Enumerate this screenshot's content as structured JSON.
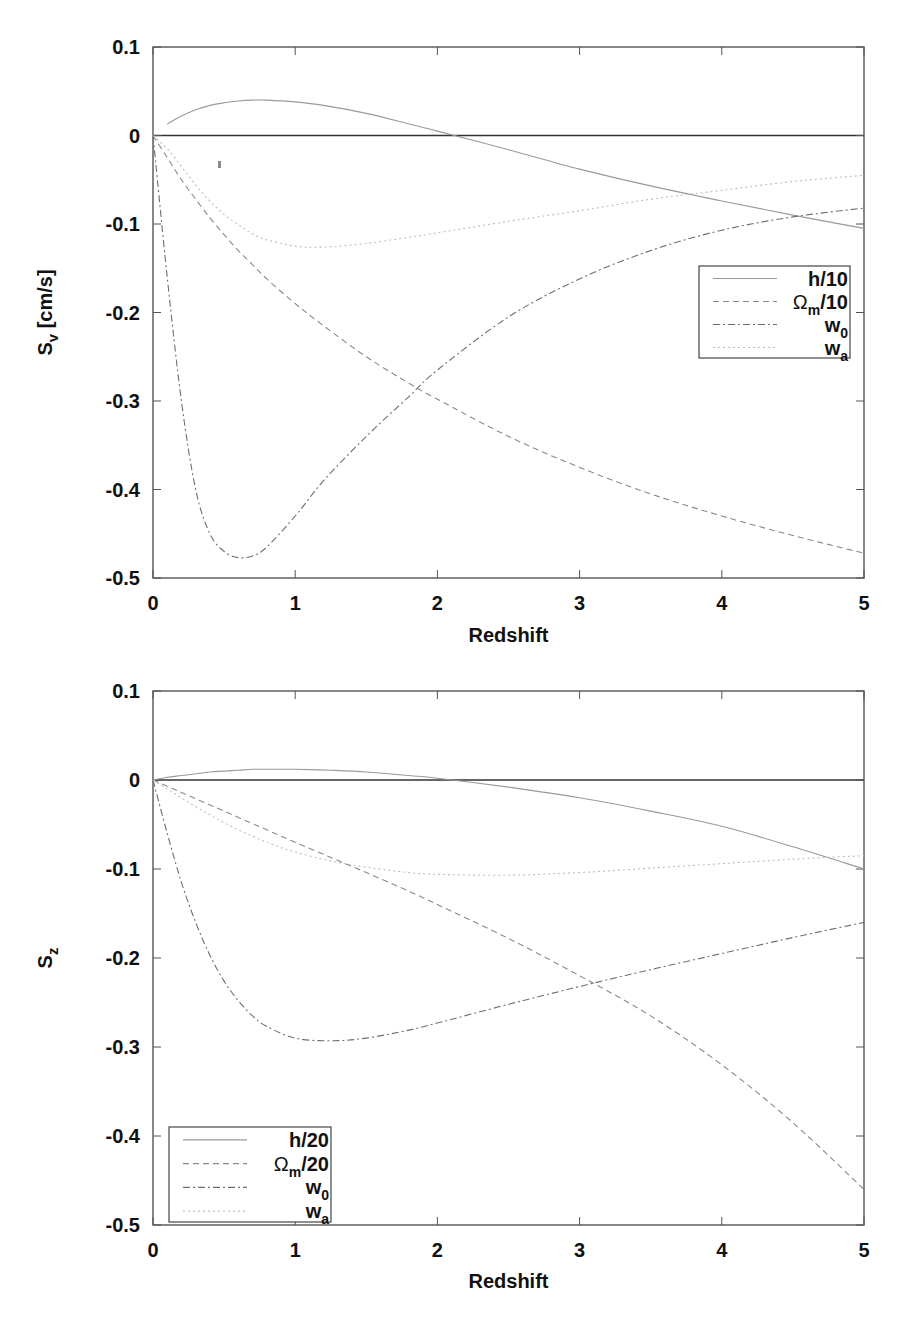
{
  "chart_data": [
    {
      "type": "line",
      "title": "",
      "xlabel": "Redshift",
      "ylabel": "S_v [cm/s]",
      "ylabel_main": "S",
      "ylabel_sub": "v",
      "ylabel_unit": " [cm/s]",
      "xlim": [
        0,
        5
      ],
      "ylim": [
        -0.5,
        0.1
      ],
      "xticks": [
        "0",
        "1",
        "2",
        "3",
        "4",
        "5"
      ],
      "yticks": [
        "0.1",
        "0",
        "-0.1",
        "-0.2",
        "-0.3",
        "-0.4",
        "-0.5"
      ],
      "grid": false,
      "zero_line": true,
      "legend_position": "right-middle",
      "legend": [
        {
          "main": "h/10",
          "sub": "",
          "tail": ""
        },
        {
          "main": "Ω",
          "sub": "m",
          "tail": "/10"
        },
        {
          "main": "w",
          "sub": "0",
          "tail": ""
        },
        {
          "main": "w",
          "sub": "a",
          "tail": ""
        }
      ],
      "x": [
        0,
        0.1,
        0.2,
        0.3,
        0.4,
        0.5,
        0.6,
        0.7,
        0.8,
        1.0,
        1.2,
        1.5,
        1.8,
        2.0,
        2.5,
        3.0,
        3.5,
        4.0,
        4.5,
        5.0
      ],
      "series": [
        {
          "name": "h/10",
          "style": "solid",
          "values": [
            null,
            0.013,
            0.022,
            0.029,
            0.034,
            0.037,
            0.039,
            0.04,
            0.04,
            0.038,
            0.034,
            0.025,
            0.013,
            0.005,
            -0.016,
            -0.038,
            -0.057,
            -0.074,
            -0.09,
            -0.105
          ]
        },
        {
          "name": "Ωm/10",
          "style": "dashed",
          "values": [
            0,
            -0.025,
            -0.05,
            -0.072,
            -0.093,
            -0.112,
            -0.13,
            -0.146,
            -0.162,
            -0.19,
            -0.215,
            -0.25,
            -0.28,
            -0.298,
            -0.34,
            -0.375,
            -0.405,
            -0.43,
            -0.452,
            -0.472
          ]
        },
        {
          "name": "w0",
          "style": "dashdot",
          "values": [
            0,
            -0.16,
            -0.3,
            -0.4,
            -0.45,
            -0.47,
            -0.477,
            -0.475,
            -0.465,
            -0.43,
            -0.39,
            -0.34,
            -0.295,
            -0.265,
            -0.205,
            -0.162,
            -0.13,
            -0.107,
            -0.092,
            -0.082
          ]
        },
        {
          "name": "wa",
          "style": "dotted",
          "values": [
            0,
            -0.015,
            -0.035,
            -0.056,
            -0.074,
            -0.089,
            -0.101,
            -0.111,
            -0.118,
            -0.125,
            -0.126,
            -0.122,
            -0.115,
            -0.11,
            -0.097,
            -0.085,
            -0.072,
            -0.062,
            -0.052,
            -0.045
          ]
        }
      ]
    },
    {
      "type": "line",
      "title": "",
      "xlabel": "Redshift",
      "ylabel": "S_z",
      "ylabel_main": "S",
      "ylabel_sub": "z",
      "ylabel_unit": "",
      "xlim": [
        0,
        5
      ],
      "ylim": [
        -0.5,
        0.1
      ],
      "xticks": [
        "0",
        "1",
        "2",
        "3",
        "4",
        "5"
      ],
      "yticks": [
        "0.1",
        "0",
        "-0.1",
        "-0.2",
        "-0.3",
        "-0.4",
        "-0.5"
      ],
      "grid": false,
      "zero_line": true,
      "legend_position": "lower-left",
      "legend": [
        {
          "main": "h/20",
          "sub": "",
          "tail": ""
        },
        {
          "main": "Ω",
          "sub": "m",
          "tail": "/20"
        },
        {
          "main": "w",
          "sub": "0",
          "tail": ""
        },
        {
          "main": "w",
          "sub": "a",
          "tail": ""
        }
      ],
      "x": [
        0,
        0.1,
        0.2,
        0.3,
        0.4,
        0.5,
        0.6,
        0.7,
        0.8,
        1.0,
        1.25,
        1.5,
        1.8,
        2.0,
        2.5,
        3.0,
        3.5,
        4.0,
        4.5,
        5.0
      ],
      "series": [
        {
          "name": "h/20",
          "style": "solid",
          "values": [
            0,
            0.003,
            0.005,
            0.007,
            0.009,
            0.01,
            0.011,
            0.012,
            0.012,
            0.012,
            0.011,
            0.009,
            0.005,
            0.002,
            -0.008,
            -0.02,
            -0.035,
            -0.052,
            -0.075,
            -0.1
          ]
        },
        {
          "name": "Ωm/20",
          "style": "dashed",
          "values": [
            0,
            -0.007,
            -0.014,
            -0.021,
            -0.028,
            -0.035,
            -0.042,
            -0.049,
            -0.056,
            -0.07,
            -0.087,
            -0.104,
            -0.125,
            -0.14,
            -0.178,
            -0.22,
            -0.265,
            -0.32,
            -0.385,
            -0.46
          ]
        },
        {
          "name": "w0",
          "style": "dashdot",
          "values": [
            0,
            -0.06,
            -0.115,
            -0.16,
            -0.197,
            -0.226,
            -0.248,
            -0.265,
            -0.277,
            -0.29,
            -0.293,
            -0.29,
            -0.281,
            -0.273,
            -0.252,
            -0.232,
            -0.213,
            -0.195,
            -0.177,
            -0.16
          ]
        },
        {
          "name": "wa",
          "style": "dotted",
          "values": [
            0,
            -0.01,
            -0.02,
            -0.03,
            -0.039,
            -0.048,
            -0.056,
            -0.063,
            -0.07,
            -0.081,
            -0.091,
            -0.098,
            -0.104,
            -0.106,
            -0.107,
            -0.104,
            -0.099,
            -0.094,
            -0.089,
            -0.085
          ]
        }
      ]
    }
  ]
}
